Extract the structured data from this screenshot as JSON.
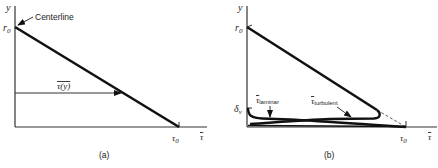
{
  "panels": [
    {
      "id": "a",
      "caption": "(a)",
      "y_axis_label": "y",
      "x_axis_label": "τ",
      "y_intercept_label": "r",
      "y_intercept_sub": "0",
      "x_intercept_label": "τ",
      "x_intercept_sub": "0",
      "centerline_label": "Centerline",
      "arrow_label": "τ(y)"
    },
    {
      "id": "b",
      "caption": "(b)",
      "y_axis_label": "y",
      "x_axis_label": "τ",
      "y_intercept_label": "r",
      "y_intercept_sub": "0",
      "x_intercept_label": "τ",
      "x_intercept_sub": "0",
      "delta_label": "δ",
      "delta_sub": "v",
      "laminar_label": "τ",
      "laminar_sub": "laminar",
      "turbulent_label": "τ",
      "turbulent_sub": "turbulent"
    }
  ],
  "colors": {
    "ink": "#111111",
    "background": "#ffffff"
  }
}
